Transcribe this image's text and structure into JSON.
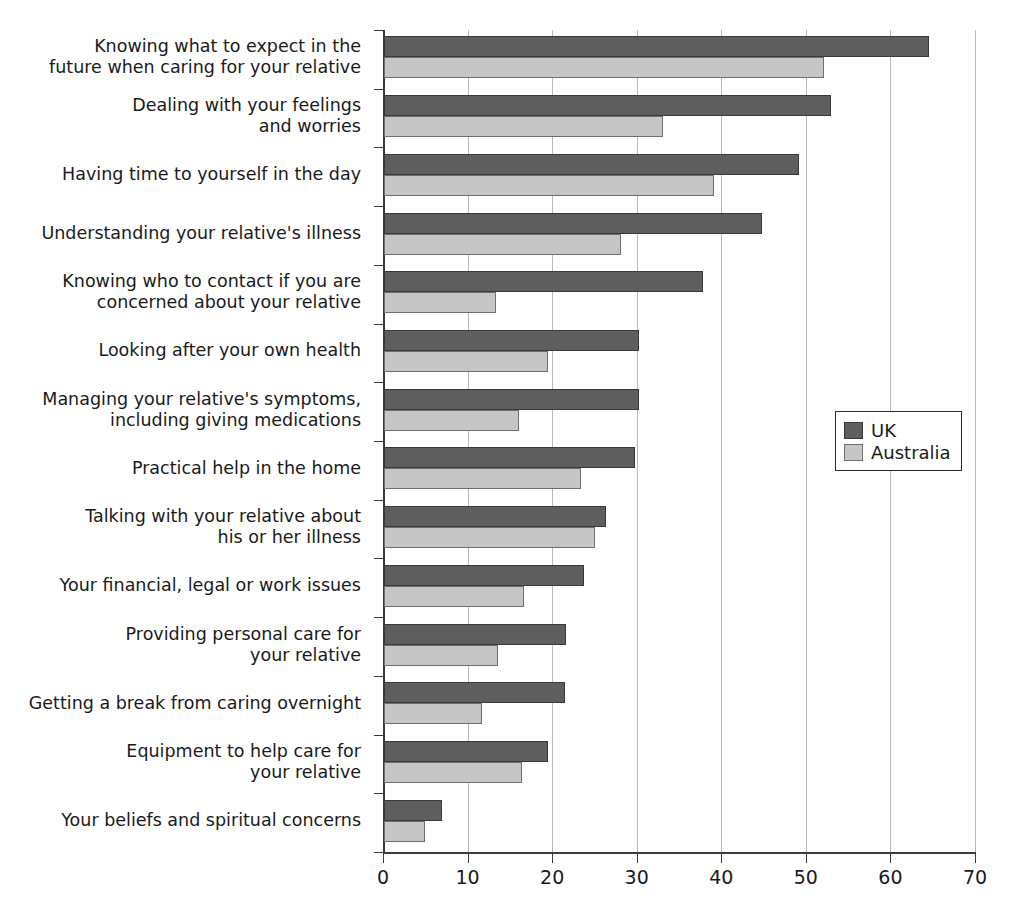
{
  "chart_data": {
    "type": "bar",
    "orientation": "horizontal",
    "title": "",
    "subtitle": "",
    "xlabel": "",
    "ylabel": "",
    "xlim": [
      0,
      70
    ],
    "xticks": [
      0,
      10,
      20,
      30,
      40,
      50,
      60,
      70
    ],
    "xtick_labels": [
      "0",
      "10",
      "20",
      "30",
      "40",
      "50",
      "60",
      "70"
    ],
    "grid": true,
    "grid_axis": "x",
    "legend": {
      "position": "right-middle",
      "entries": [
        {
          "name": "UK",
          "color": "#5e5e5e"
        },
        {
          "name": "Australia",
          "color": "#c6c6c6"
        }
      ]
    },
    "categories": [
      "Knowing what to expect in the\nfuture when caring for your relative",
      "Dealing with your feelings\nand worries",
      "Having time to yourself in the day",
      "Understanding your relative's illness",
      "Knowing who to contact if you are\nconcerned about your relative",
      "Looking after your own health",
      "Managing your relative's symptoms,\nincluding giving medications",
      "Practical help in the home",
      "Talking with your relative about\nhis or her illness",
      "Your financial, legal or work issues",
      "Providing personal care for\nyour relative",
      "Getting a break from caring overnight",
      "Equipment to help care for\nyour relative",
      "Your beliefs and spiritual concerns"
    ],
    "series": [
      {
        "name": "UK",
        "color": "#5e5e5e",
        "values": [
          64.4,
          52.8,
          49.1,
          44.7,
          37.7,
          30.2,
          30.1,
          29.7,
          26.2,
          23.6,
          21.5,
          21.4,
          19.4,
          6.8
        ]
      },
      {
        "name": "Australia",
        "color": "#c6c6c6",
        "values": [
          52.0,
          33.0,
          39.0,
          28.0,
          13.3,
          19.4,
          16.0,
          23.3,
          25.0,
          16.6,
          13.5,
          11.6,
          16.3,
          4.9
        ]
      }
    ]
  },
  "axis": {
    "x_labels": [
      "0",
      "10",
      "20",
      "30",
      "40",
      "50",
      "60",
      "70"
    ]
  },
  "legend": {
    "uk_label": "UK",
    "australia_label": "Australia"
  }
}
